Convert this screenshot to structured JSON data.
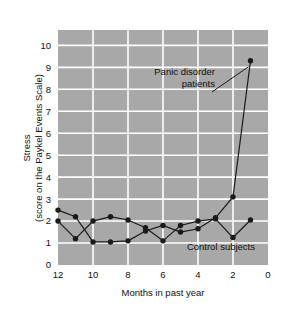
{
  "chart_data": {
    "type": "line",
    "title": "",
    "xlabel": "Months in past year",
    "ylabel_line1": "Stress",
    "ylabel_line2": "(score on the Paykel Events Scale)",
    "xlim": [
      12,
      0
    ],
    "ylim": [
      0,
      10.7
    ],
    "x_ticks": [
      12,
      10,
      8,
      6,
      4,
      2,
      0
    ],
    "x_tick_labels": [
      "12",
      "10",
      "8",
      "6",
      "4",
      "2",
      "0"
    ],
    "y_ticks": [
      0,
      1,
      2,
      3,
      4,
      5,
      6,
      7,
      8,
      9,
      10
    ],
    "y_tick_labels": [
      "0",
      "1",
      "2",
      "3",
      "4",
      "5",
      "6",
      "7",
      "8",
      "9",
      "10"
    ],
    "x_axis_reversed": true,
    "grid": true,
    "grid_color": "#ffffff",
    "plot_background": "#a8a8a8",
    "legend_position": "inline-annotations",
    "series": [
      {
        "name": "Panic disorder patients",
        "color": "#1a1a1a",
        "marker": "circle",
        "x": [
          12,
          11,
          10,
          9,
          8,
          7,
          6,
          5,
          4,
          3,
          2,
          1
        ],
        "values": [
          2.5,
          2.2,
          1.05,
          1.05,
          1.1,
          1.55,
          1.8,
          1.5,
          1.65,
          2.15,
          3.1,
          9.3
        ]
      },
      {
        "name": "Control subjects",
        "color": "#1a1a1a",
        "marker": "circle",
        "x": [
          12,
          11,
          10,
          9,
          8,
          7,
          6,
          5,
          4,
          3,
          2,
          1
        ],
        "values": [
          2.0,
          1.2,
          2.0,
          2.2,
          2.05,
          1.7,
          1.1,
          1.8,
          2.0,
          2.1,
          1.25,
          2.05
        ]
      }
    ],
    "annotations": [
      {
        "name": "panic-disorder-patients",
        "text_line1": "Panic disorder",
        "text_line2": "patients",
        "anchor_x": 1,
        "anchor_y": 9.3
      },
      {
        "name": "control-subjects",
        "text_line1": "Control subjects",
        "anchor_x": 2,
        "anchor_y": 1.25
      }
    ]
  }
}
